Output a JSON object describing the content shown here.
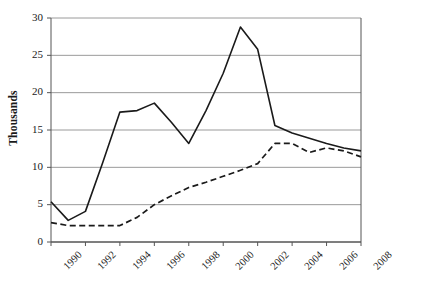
{
  "chart_data": {
    "type": "line",
    "title": "",
    "xlabel": "",
    "ylabel": "Thousands",
    "xlim": [
      1990,
      2008
    ],
    "ylim": [
      0,
      30
    ],
    "ytick_values": [
      0,
      5,
      10,
      15,
      20,
      25,
      30
    ],
    "ytick_labels": [
      "0",
      "5",
      "10",
      "15",
      "20",
      "25",
      "30"
    ],
    "xtick_values": [
      1990,
      1992,
      1994,
      1996,
      1998,
      2000,
      2002,
      2004,
      2006,
      2008
    ],
    "xtick_labels": [
      "1990",
      "1992",
      "1994",
      "1996",
      "1998",
      "2000",
      "2002",
      "2004",
      "2006",
      "2008"
    ],
    "grid": "horizontal",
    "legend": "none",
    "x": [
      1990,
      1991,
      1992,
      1993,
      1994,
      1995,
      1996,
      1997,
      1998,
      1999,
      2000,
      2001,
      2002,
      2003,
      2004,
      2005,
      2006,
      2007,
      2008
    ],
    "series": [
      {
        "name": "solid-series",
        "style": "solid",
        "color": "#1a1a1a",
        "values": [
          5.4,
          2.9,
          4.1,
          10.6,
          17.4,
          17.6,
          18.6,
          16.0,
          13.2,
          17.6,
          22.6,
          28.8,
          25.8,
          15.6,
          14.6,
          13.9,
          13.2,
          12.6,
          12.2
        ]
      },
      {
        "name": "dashed-series",
        "style": "dashed",
        "color": "#1a1a1a",
        "values": [
          2.6,
          2.2,
          2.2,
          2.2,
          2.2,
          3.3,
          5.0,
          6.2,
          7.3,
          8.0,
          8.8,
          9.6,
          10.5,
          13.2,
          13.2,
          12.0,
          12.6,
          12.2,
          11.4
        ]
      }
    ]
  }
}
